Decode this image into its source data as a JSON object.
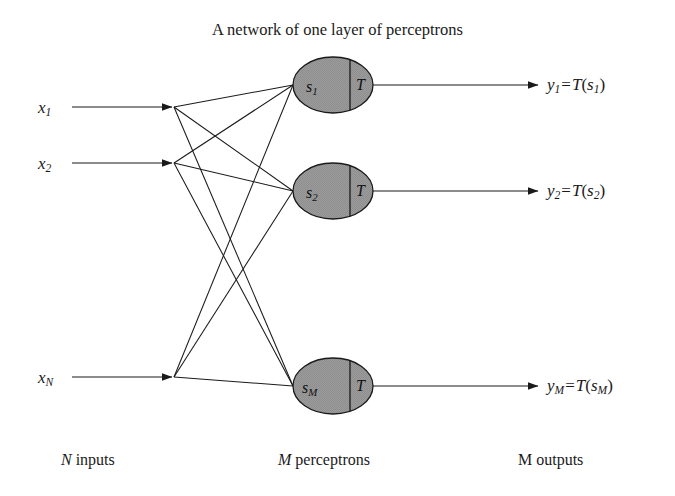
{
  "figure": {
    "title": "A network of one layer of perceptrons",
    "background_color": "#ffffff",
    "stroke_color": "#1a1a1a",
    "neuron_fill_color": "#9a9a9a"
  },
  "inputs": [
    {
      "name": "input-x1",
      "base": "x",
      "sub": "1"
    },
    {
      "name": "input-x2",
      "base": "x",
      "sub": "2"
    },
    {
      "name": "input-xN",
      "base": "x",
      "sub": "N"
    }
  ],
  "neurons": [
    {
      "name": "perceptron-1",
      "sum_base": "s",
      "sum_sub": "1",
      "threshold": "T"
    },
    {
      "name": "perceptron-2",
      "sum_base": "s",
      "sum_sub": "2",
      "threshold": "T"
    },
    {
      "name": "perceptron-M",
      "sum_base": "s",
      "sum_sub": "M",
      "threshold": "T"
    }
  ],
  "outputs": [
    {
      "name": "output-y1",
      "base": "y",
      "sub": "1",
      "eq": "=",
      "func": "T",
      "arg_base": "s",
      "arg_sub": "1"
    },
    {
      "name": "output-y2",
      "base": "y",
      "sub": "2",
      "eq": "=",
      "func": "T",
      "arg_base": "s",
      "arg_sub": "2"
    },
    {
      "name": "output-yM",
      "base": "y",
      "sub": "M",
      "eq": "=",
      "func": "T",
      "arg_base": "s",
      "arg_sub": "M"
    }
  ],
  "captions": {
    "inputs": {
      "var": "N",
      "text": " inputs"
    },
    "perceptrons": {
      "var": "M",
      "text": " perceptrons"
    },
    "outputs": {
      "var": "",
      "text": "M outputs"
    }
  }
}
